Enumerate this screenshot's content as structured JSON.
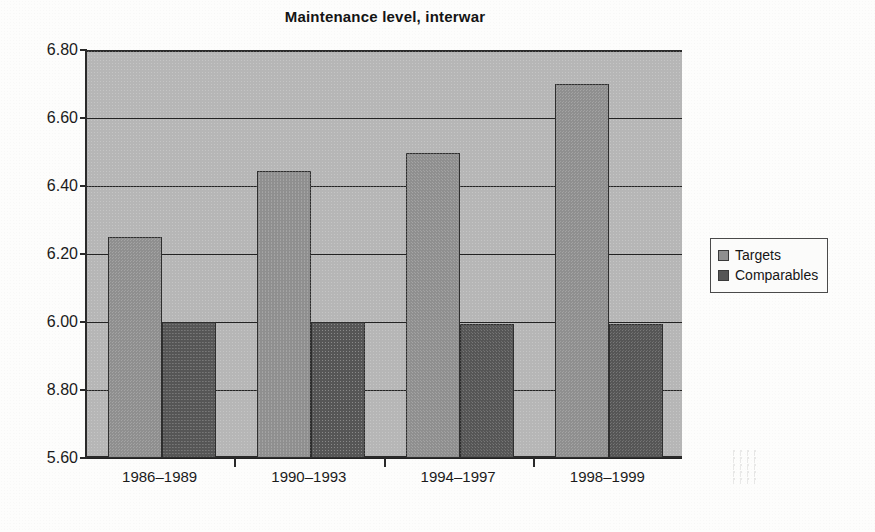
{
  "chart_data": {
    "type": "bar",
    "title": "Maintenance level, interwar",
    "xlabel": "",
    "ylabel": "",
    "categories": [
      "1986–1989",
      "1990–1993",
      "1994–1997",
      "1998–1999"
    ],
    "series": [
      {
        "name": "Targets",
        "values": [
          6.25,
          6.445,
          6.497,
          6.7
        ],
        "color": "#8f8f8f"
      },
      {
        "name": "Comparables",
        "values": [
          6.0,
          6.0,
          5.995,
          5.995
        ],
        "color": "#565656"
      }
    ],
    "ylim": [
      5.6,
      6.8
    ],
    "ytick_values": [
      6.8,
      6.6,
      6.4,
      6.2,
      6.0,
      5.8,
      5.6
    ],
    "ytick_labels": [
      "6.80",
      "6.60",
      "6.40",
      "6.20",
      "6.00",
      "8.80",
      "5.60"
    ],
    "grid": true,
    "legend_position": "right",
    "plot_background": "#b6b6b6"
  },
  "legend": {
    "entries": [
      {
        "label": "Targets",
        "color": "#8f8f8f"
      },
      {
        "label": "Comparables",
        "color": "#565656"
      }
    ]
  }
}
